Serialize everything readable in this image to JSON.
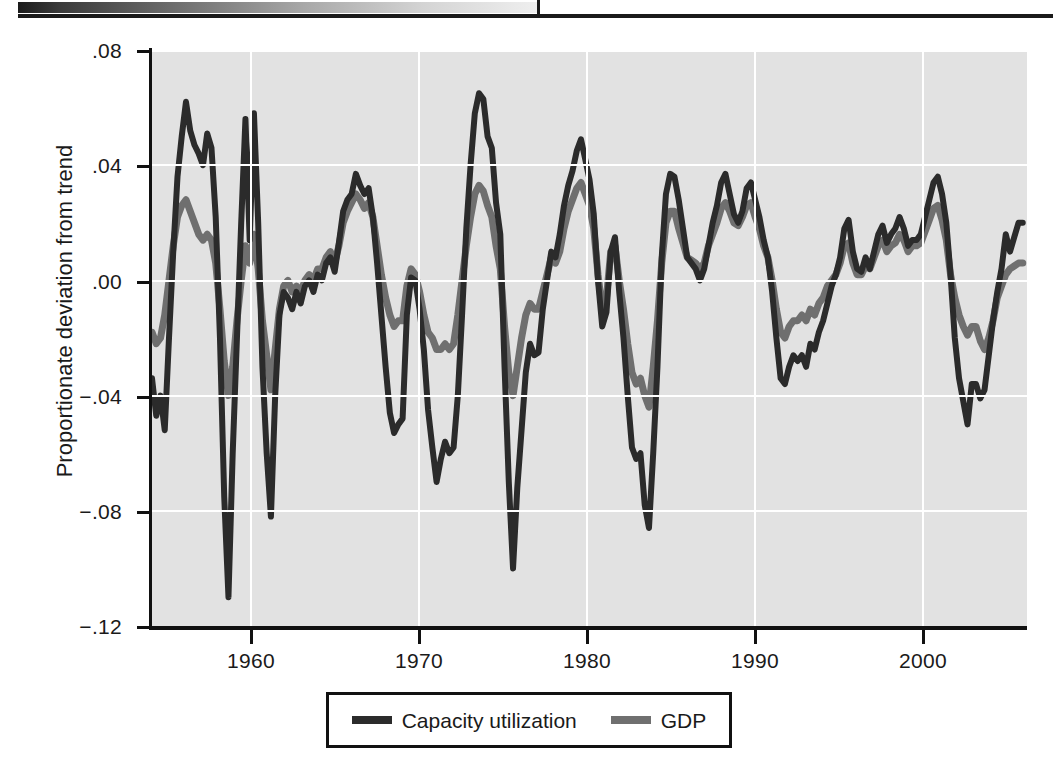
{
  "chart_data": {
    "type": "line",
    "title": "",
    "xlabel": "",
    "ylabel": "Proportionate deviation from trend",
    "xlim": [
      1954.0,
      2005.5
    ],
    "ylim": [
      -0.12,
      0.08
    ],
    "grid": true,
    "legend_position": "below-center",
    "x_ticks": [
      "1960",
      "1970",
      "1980",
      "1990",
      "2000"
    ],
    "x_tick_values": [
      1960,
      1970,
      1980,
      1990,
      2000
    ],
    "y_ticks": [
      ".08",
      ".04",
      ".00",
      "−.04",
      "−.08",
      "−.12"
    ],
    "y_tick_values": [
      0.08,
      0.04,
      0.0,
      -0.04,
      -0.08,
      -0.12
    ],
    "colors": {
      "capacity_utilization": "#2b2b2b",
      "gdp": "#6f6f6f",
      "plot_background": "#e2e2e2",
      "gridline": "#ffffff",
      "axis": "#111111"
    },
    "x": [
      1954.0,
      1954.25,
      1954.5,
      1954.75,
      1955.0,
      1955.25,
      1955.5,
      1955.75,
      1956.0,
      1956.25,
      1956.5,
      1956.75,
      1957.0,
      1957.25,
      1957.5,
      1957.75,
      1958.0,
      1958.25,
      1958.5,
      1958.75,
      1959.0,
      1959.25,
      1959.5,
      1959.75,
      1960.0,
      1960.25,
      1960.5,
      1960.75,
      1961.0,
      1961.25,
      1961.5,
      1961.75,
      1962.0,
      1962.25,
      1962.5,
      1962.75,
      1963.0,
      1963.25,
      1963.5,
      1963.75,
      1964.0,
      1964.25,
      1964.5,
      1964.75,
      1965.0,
      1965.25,
      1965.5,
      1965.75,
      1966.0,
      1966.25,
      1966.5,
      1966.75,
      1967.0,
      1967.25,
      1967.5,
      1967.75,
      1968.0,
      1968.25,
      1968.5,
      1968.75,
      1969.0,
      1969.25,
      1969.5,
      1969.75,
      1970.0,
      1970.25,
      1970.5,
      1970.75,
      1971.0,
      1971.25,
      1971.5,
      1971.75,
      1972.0,
      1972.25,
      1972.5,
      1972.75,
      1973.0,
      1973.25,
      1973.5,
      1973.75,
      1974.0,
      1974.25,
      1974.5,
      1974.75,
      1975.0,
      1975.25,
      1975.5,
      1975.75,
      1976.0,
      1976.25,
      1976.5,
      1976.75,
      1977.0,
      1977.25,
      1977.5,
      1977.75,
      1978.0,
      1978.25,
      1978.5,
      1978.75,
      1979.0,
      1979.25,
      1979.5,
      1979.75,
      1980.0,
      1980.25,
      1980.5,
      1980.75,
      1981.0,
      1981.25,
      1981.5,
      1981.75,
      1982.0,
      1982.25,
      1982.5,
      1982.75,
      1983.0,
      1983.25,
      1983.5,
      1983.75,
      1984.0,
      1984.25,
      1984.5,
      1984.75,
      1985.0,
      1985.25,
      1985.5,
      1985.75,
      1986.0,
      1986.25,
      1986.5,
      1986.75,
      1987.0,
      1987.25,
      1987.5,
      1987.75,
      1988.0,
      1988.25,
      1988.5,
      1988.75,
      1989.0,
      1989.25,
      1989.5,
      1989.75,
      1990.0,
      1990.25,
      1990.5,
      1990.75,
      1991.0,
      1991.25,
      1991.5,
      1991.75,
      1992.0,
      1992.25,
      1992.5,
      1992.75,
      1993.0,
      1993.25,
      1993.5,
      1993.75,
      1994.0,
      1994.25,
      1994.5,
      1994.75,
      1995.0,
      1995.25,
      1995.5,
      1995.75,
      1996.0,
      1996.25,
      1996.5,
      1996.75,
      1997.0,
      1997.25,
      1997.5,
      1997.75,
      1998.0,
      1998.25,
      1998.5,
      1998.75,
      1999.0,
      1999.25,
      1999.5,
      1999.75,
      2000.0,
      2000.25,
      2000.5,
      2000.75,
      2001.0,
      2001.25,
      2001.5,
      2001.75,
      2002.0,
      2002.25,
      2002.5,
      2002.75,
      2003.0,
      2003.25,
      2003.5,
      2003.75,
      2004.0,
      2004.25,
      2004.5,
      2004.75,
      2005.0,
      2005.25
    ],
    "series": [
      {
        "name": "Capacity utilization",
        "color": "#2b2b2b",
        "values": [
          -0.034,
          -0.047,
          -0.04,
          -0.052,
          -0.02,
          0.01,
          0.036,
          0.05,
          0.062,
          0.052,
          0.047,
          0.044,
          0.04,
          0.051,
          0.046,
          0.022,
          -0.02,
          -0.075,
          -0.11,
          -0.06,
          -0.02,
          0.02,
          0.056,
          0.014,
          0.058,
          0.02,
          -0.03,
          -0.06,
          -0.082,
          -0.04,
          -0.012,
          -0.004,
          -0.006,
          -0.01,
          -0.004,
          -0.008,
          -0.002,
          0.0,
          -0.004,
          0.002,
          0.0,
          0.006,
          0.008,
          0.003,
          0.013,
          0.024,
          0.028,
          0.03,
          0.037,
          0.033,
          0.03,
          0.032,
          0.022,
          0.006,
          -0.012,
          -0.03,
          -0.046,
          -0.053,
          -0.05,
          -0.048,
          -0.012,
          0.001,
          0.0,
          -0.01,
          -0.024,
          -0.045,
          -0.058,
          -0.07,
          -0.062,
          -0.056,
          -0.06,
          -0.058,
          -0.04,
          -0.012,
          0.018,
          0.04,
          0.058,
          0.065,
          0.063,
          0.05,
          0.046,
          0.027,
          0.016,
          -0.03,
          -0.07,
          -0.1,
          -0.072,
          -0.052,
          -0.032,
          -0.022,
          -0.026,
          -0.025,
          -0.01,
          0.0,
          0.01,
          0.008,
          0.016,
          0.026,
          0.033,
          0.038,
          0.045,
          0.049,
          0.042,
          0.035,
          0.023,
          0.0,
          -0.016,
          -0.011,
          0.01,
          0.015,
          -0.004,
          -0.02,
          -0.04,
          -0.058,
          -0.062,
          -0.06,
          -0.078,
          -0.086,
          -0.06,
          -0.03,
          0.008,
          0.03,
          0.037,
          0.036,
          0.028,
          0.018,
          0.008,
          0.006,
          0.004,
          0.0,
          0.004,
          0.012,
          0.02,
          0.026,
          0.034,
          0.037,
          0.03,
          0.023,
          0.02,
          0.024,
          0.032,
          0.034,
          0.028,
          0.022,
          0.014,
          0.008,
          -0.004,
          -0.02,
          -0.034,
          -0.036,
          -0.03,
          -0.026,
          -0.028,
          -0.026,
          -0.03,
          -0.022,
          -0.024,
          -0.018,
          -0.014,
          -0.008,
          -0.002,
          0.002,
          0.008,
          0.018,
          0.021,
          0.01,
          0.004,
          0.003,
          0.008,
          0.004,
          0.01,
          0.016,
          0.019,
          0.013,
          0.016,
          0.018,
          0.022,
          0.018,
          0.012,
          0.014,
          0.014,
          0.016,
          0.022,
          0.028,
          0.034,
          0.036,
          0.03,
          0.02,
          0.002,
          -0.02,
          -0.034,
          -0.042,
          -0.05,
          -0.036,
          -0.036,
          -0.041,
          -0.038,
          -0.026,
          -0.014,
          -0.004,
          0.004,
          0.016,
          0.01,
          0.015,
          0.02,
          0.02
        ]
      },
      {
        "name": "GDP",
        "color": "#6f6f6f",
        "values": [
          -0.018,
          -0.022,
          -0.02,
          -0.012,
          0.0,
          0.012,
          0.022,
          0.026,
          0.028,
          0.024,
          0.02,
          0.016,
          0.014,
          0.016,
          0.014,
          0.006,
          -0.01,
          -0.028,
          -0.04,
          -0.03,
          -0.014,
          0.0,
          0.012,
          0.006,
          0.016,
          0.004,
          -0.014,
          -0.026,
          -0.038,
          -0.024,
          -0.01,
          -0.002,
          0.0,
          -0.004,
          -0.002,
          -0.004,
          0.0,
          0.002,
          0.0,
          0.004,
          0.004,
          0.008,
          0.01,
          0.006,
          0.012,
          0.02,
          0.024,
          0.027,
          0.03,
          0.028,
          0.025,
          0.027,
          0.022,
          0.012,
          0.002,
          -0.006,
          -0.012,
          -0.016,
          -0.014,
          -0.014,
          -0.002,
          0.004,
          0.002,
          -0.004,
          -0.012,
          -0.018,
          -0.02,
          -0.024,
          -0.024,
          -0.022,
          -0.024,
          -0.022,
          -0.012,
          0.0,
          0.012,
          0.022,
          0.03,
          0.033,
          0.031,
          0.026,
          0.022,
          0.012,
          0.004,
          -0.016,
          -0.032,
          -0.04,
          -0.03,
          -0.02,
          -0.012,
          -0.008,
          -0.01,
          -0.01,
          -0.004,
          0.002,
          0.008,
          0.006,
          0.01,
          0.018,
          0.024,
          0.028,
          0.032,
          0.034,
          0.03,
          0.026,
          0.018,
          0.002,
          -0.01,
          -0.006,
          0.01,
          0.012,
          0.0,
          -0.01,
          -0.022,
          -0.032,
          -0.036,
          -0.034,
          -0.04,
          -0.044,
          -0.03,
          -0.014,
          0.006,
          0.02,
          0.024,
          0.024,
          0.018,
          0.013,
          0.008,
          0.007,
          0.006,
          0.004,
          0.006,
          0.012,
          0.016,
          0.02,
          0.025,
          0.027,
          0.024,
          0.02,
          0.019,
          0.022,
          0.026,
          0.027,
          0.022,
          0.018,
          0.012,
          0.008,
          0.0,
          -0.01,
          -0.018,
          -0.02,
          -0.016,
          -0.014,
          -0.014,
          -0.012,
          -0.014,
          -0.01,
          -0.012,
          -0.008,
          -0.006,
          -0.002,
          0.0,
          0.002,
          0.006,
          0.012,
          0.013,
          0.006,
          0.002,
          0.002,
          0.005,
          0.004,
          0.008,
          0.012,
          0.014,
          0.01,
          0.012,
          0.013,
          0.016,
          0.014,
          0.01,
          0.012,
          0.012,
          0.013,
          0.017,
          0.021,
          0.025,
          0.026,
          0.021,
          0.014,
          0.002,
          -0.006,
          -0.012,
          -0.016,
          -0.019,
          -0.016,
          -0.016,
          -0.021,
          -0.024,
          -0.02,
          -0.014,
          -0.006,
          -0.002,
          0.002,
          0.004,
          0.005,
          0.006,
          0.006
        ]
      }
    ]
  },
  "axis": {
    "y_title": "Proportionate deviation from trend",
    "y_labels": [
      ".08",
      ".04",
      ".00",
      "−.04",
      "−.08",
      "−.12"
    ],
    "x_labels": [
      "1960",
      "1970",
      "1980",
      "1990",
      "2000"
    ]
  },
  "legend": {
    "entries": [
      {
        "label": "Capacity utilization",
        "color": "#2b2b2b"
      },
      {
        "label": "GDP",
        "color": "#6f6f6f"
      }
    ]
  }
}
